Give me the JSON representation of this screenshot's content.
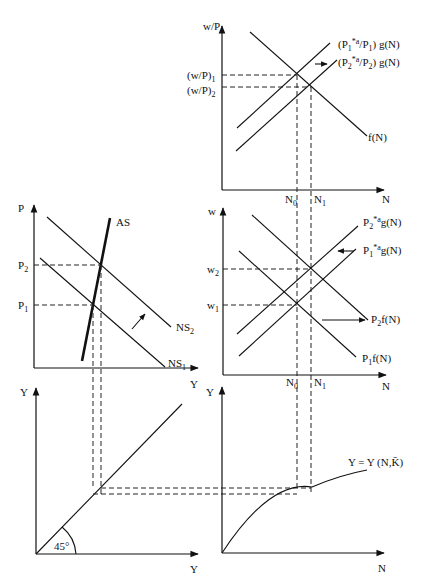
{
  "diagram": {
    "type": "four-quadrant macroeconomic labor market / aggregate supply diagram",
    "panels": {
      "top_right": {
        "y_axis_label": "w/P",
        "x_axis_label": "N",
        "y_ticks": [
          "(w/P)1",
          "(w/P)2"
        ],
        "x_ticks": [
          "N0",
          "N1"
        ],
        "curves": [
          "(P1*a/P1) g(N)",
          "(P2*a/P2) g(N)",
          "f(N)"
        ],
        "shift_arrow": "rightward shift of labor supply"
      },
      "middle_left": {
        "y_axis_label": "P",
        "x_axis_label": "Y",
        "y_ticks": [
          "P2",
          "P1"
        ],
        "curves": [
          "AS",
          "NS2",
          "NS1"
        ],
        "shift_arrow": "upward shift from NS1 to NS2"
      },
      "middle_right": {
        "y_axis_label": "w",
        "x_axis_label": "N",
        "y_ticks": [
          "w2",
          "w1"
        ],
        "x_ticks": [
          "N0",
          "N1"
        ],
        "curves": [
          "P2*a g(N)",
          "P1*a g(N)",
          "P2f(N)",
          "P1f(N)"
        ],
        "shift_arrows": [
          "leftward shift of labor supply",
          "rightward shift of labor demand"
        ]
      },
      "bottom_left": {
        "y_axis_label": "Y",
        "x_axis_label": "Y",
        "angle_label": "45°"
      },
      "bottom_right": {
        "y_axis_label": "Y",
        "x_axis_label": "N",
        "curve": "Y = Y (N,K̄)"
      }
    }
  },
  "labels": {
    "tr_y": "w/P",
    "tr_x": "N",
    "tr_wp1": "(w/P)",
    "tr_wp1_sub": "1",
    "tr_wp2": "(w/P)",
    "tr_wp2_sub": "2",
    "tr_n0": "N",
    "tr_n0_sub": "0",
    "tr_n1": "N",
    "tr_n1_sub": "1",
    "tr_supply1_a": "(P",
    "tr_supply1_b": "1",
    "tr_supply1_c": "*",
    "tr_supply1_d": "a",
    "tr_supply1_e": "/P",
    "tr_supply1_f": "1",
    "tr_supply1_g": ") g(N)",
    "tr_supply2_a": "(P",
    "tr_supply2_b": "2",
    "tr_supply2_c": "*",
    "tr_supply2_d": "a",
    "tr_supply2_e": "/P",
    "tr_supply2_f": "2",
    "tr_supply2_g": ") g(N)",
    "tr_demand": "f(N)",
    "ml_y": "P",
    "ml_x": "Y",
    "ml_p2": "P",
    "ml_p2_sub": "2",
    "ml_p1": "P",
    "ml_p1_sub": "1",
    "ml_as": "AS",
    "ml_ns2": "NS",
    "ml_ns2_sub": "2",
    "ml_ns1": "NS",
    "ml_ns1_sub": "1",
    "mr_y": "w",
    "mr_x": "N",
    "mr_w2": "w",
    "mr_w2_sub": "2",
    "mr_w1": "w",
    "mr_w1_sub": "1",
    "mr_n0": "N",
    "mr_n0_sub": "0",
    "mr_n1": "N",
    "mr_n1_sub": "1",
    "mr_s2_a": "P",
    "mr_s2_b": "2",
    "mr_s2_c": "*a",
    "mr_s2_d": "g(N)",
    "mr_s1_a": "P",
    "mr_s1_b": "1",
    "mr_s1_c": "*a",
    "mr_s1_d": "g(N)",
    "mr_d2_a": "P",
    "mr_d2_b": "2",
    "mr_d2_c": "f(N)",
    "mr_d1_a": "P",
    "mr_d1_b": "1",
    "mr_d1_c": "f(N)",
    "bl_y": "Y",
    "bl_x": "Y",
    "bl_angle": "45°",
    "br_y": "Y",
    "br_x": "N",
    "br_curve": "Y = Y (N,K̄)"
  }
}
